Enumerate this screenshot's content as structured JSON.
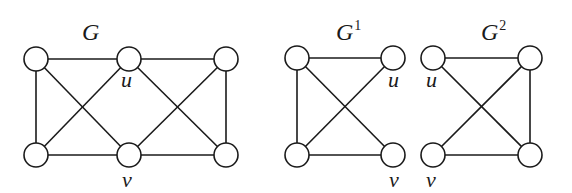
{
  "figure": {
    "background": "#ffffff",
    "stroke_color": "#1a1a1a",
    "graphs": [
      {
        "id": "G",
        "title": "G",
        "superscript": "",
        "title_pos": [
          82,
          40
        ],
        "nodes": [
          {
            "id": "a",
            "x": 36,
            "y": 59,
            "label": ""
          },
          {
            "id": "u",
            "x": 129,
            "y": 59,
            "label": "u",
            "label_pos": [
              121,
              87
            ]
          },
          {
            "id": "c",
            "x": 226,
            "y": 59,
            "label": ""
          },
          {
            "id": "d",
            "x": 36,
            "y": 155,
            "label": ""
          },
          {
            "id": "v",
            "x": 129,
            "y": 155,
            "label": "v",
            "label_pos": [
              122,
              187
            ]
          },
          {
            "id": "f",
            "x": 226,
            "y": 155,
            "label": ""
          }
        ],
        "edges": [
          [
            "a",
            "u"
          ],
          [
            "u",
            "c"
          ],
          [
            "d",
            "v"
          ],
          [
            "v",
            "f"
          ],
          [
            "a",
            "d"
          ],
          [
            "c",
            "f"
          ],
          [
            "a",
            "v"
          ],
          [
            "u",
            "d"
          ],
          [
            "u",
            "f"
          ],
          [
            "c",
            "v"
          ]
        ]
      },
      {
        "id": "G1",
        "title": "G",
        "superscript": "1",
        "title_pos": [
          336,
          40
        ],
        "nodes": [
          {
            "id": "a",
            "x": 297,
            "y": 58,
            "label": ""
          },
          {
            "id": "u",
            "x": 393,
            "y": 58,
            "label": "u",
            "label_pos": [
              388,
              87
            ]
          },
          {
            "id": "d",
            "x": 297,
            "y": 155,
            "label": ""
          },
          {
            "id": "v",
            "x": 393,
            "y": 155,
            "label": "v",
            "label_pos": [
              389,
              187
            ]
          }
        ],
        "edges": [
          [
            "a",
            "u"
          ],
          [
            "a",
            "d"
          ],
          [
            "d",
            "v"
          ],
          [
            "a",
            "v"
          ],
          [
            "u",
            "d"
          ]
        ]
      },
      {
        "id": "G2",
        "title": "G",
        "superscript": "2",
        "title_pos": [
          481,
          40
        ],
        "nodes": [
          {
            "id": "u",
            "x": 433,
            "y": 58,
            "label": "u",
            "label_pos": [
              426,
              87
            ]
          },
          {
            "id": "c",
            "x": 530,
            "y": 58,
            "label": ""
          },
          {
            "id": "v",
            "x": 433,
            "y": 155,
            "label": "v",
            "label_pos": [
              426,
              187
            ]
          },
          {
            "id": "f",
            "x": 530,
            "y": 155,
            "label": ""
          }
        ],
        "edges": [
          [
            "u",
            "c"
          ],
          [
            "c",
            "f"
          ],
          [
            "v",
            "f"
          ],
          [
            "u",
            "f"
          ],
          [
            "c",
            "v"
          ]
        ]
      }
    ],
    "node_radius": 12
  }
}
